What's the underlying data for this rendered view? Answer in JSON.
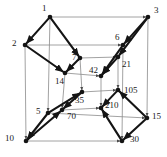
{
  "figure": {
    "kind": "hasse-diagram",
    "background_color": "#ffffff",
    "thin_edge_color": "#8a8a8a",
    "thick_edge_color": "#141414",
    "node_color": "#141414",
    "label_color": "#1a1a1a"
  },
  "chart_data": {
    "type": "diagram",
    "xlabel": "",
    "ylabel": "",
    "nodes": [
      {
        "id": "n1",
        "label": "1",
        "x": 50,
        "y": 17,
        "label_x": 42,
        "label_y": 4
      },
      {
        "id": "n2",
        "label": "2",
        "x": 25,
        "y": 45,
        "label_x": 12,
        "label_y": 39
      },
      {
        "id": "n3",
        "label": "3",
        "x": 148,
        "y": 17,
        "label_x": 154,
        "label_y": 6
      },
      {
        "id": "n5",
        "label": "5",
        "x": 48,
        "y": 113,
        "label_x": 36,
        "label_y": 107
      },
      {
        "id": "n6",
        "label": "6",
        "x": 123,
        "y": 45,
        "label_x": 115,
        "label_y": 33
      },
      {
        "id": "n7",
        "label": "7",
        "x": 80,
        "y": 58,
        "label_x": 72,
        "label_y": 53
      },
      {
        "id": "n10",
        "label": "10",
        "x": 26,
        "y": 141,
        "label_x": 5,
        "label_y": 134
      },
      {
        "id": "n14",
        "label": "14",
        "x": 65,
        "y": 73,
        "label_x": 55,
        "label_y": 77
      },
      {
        "id": "n15",
        "label": "15",
        "x": 147,
        "y": 118,
        "label_x": 152,
        "label_y": 112
      },
      {
        "id": "n21",
        "label": "21",
        "x": 118,
        "y": 57,
        "label_x": 122,
        "label_y": 60
      },
      {
        "id": "n30",
        "label": "30",
        "x": 122,
        "y": 141,
        "label_x": 130,
        "label_y": 135
      },
      {
        "id": "n35",
        "label": "35",
        "x": 82,
        "y": 92,
        "label_x": 75,
        "label_y": 96
      },
      {
        "id": "n42",
        "label": "42",
        "x": 101,
        "y": 76,
        "label_x": 89,
        "label_y": 66
      },
      {
        "id": "n70",
        "label": "70",
        "x": 62,
        "y": 110,
        "label_x": 67,
        "label_y": 112
      },
      {
        "id": "n105",
        "label": "105",
        "x": 118,
        "y": 90,
        "label_x": 124,
        "label_y": 86
      },
      {
        "id": "n210",
        "label": "210",
        "x": 101,
        "y": 108,
        "label_x": 105,
        "label_y": 101
      }
    ],
    "edges": [
      {
        "from": "n1",
        "to": "n3",
        "style": "thin"
      },
      {
        "from": "n2",
        "to": "n6",
        "style": "thin"
      },
      {
        "from": "n5",
        "to": "n15",
        "style": "thin"
      },
      {
        "from": "n10",
        "to": "n30",
        "style": "thin"
      },
      {
        "from": "n7",
        "to": "n21",
        "style": "thin"
      },
      {
        "from": "n14",
        "to": "n42",
        "style": "thin"
      },
      {
        "from": "n35",
        "to": "n105",
        "style": "thin"
      },
      {
        "from": "n70",
        "to": "n210",
        "style": "thin"
      },
      {
        "from": "n1",
        "to": "n5",
        "style": "thin"
      },
      {
        "from": "n2",
        "to": "n10",
        "style": "thin"
      },
      {
        "from": "n3",
        "to": "n15",
        "style": "thin"
      },
      {
        "from": "n6",
        "to": "n30",
        "style": "thin"
      },
      {
        "from": "n7",
        "to": "n35",
        "style": "thin"
      },
      {
        "from": "n21",
        "to": "n105",
        "style": "thin"
      },
      {
        "from": "n14",
        "to": "n70",
        "style": "thin"
      },
      {
        "from": "n42",
        "to": "n210",
        "style": "thin"
      },
      {
        "from": "n1",
        "to": "n2",
        "style": "thick"
      },
      {
        "from": "n3",
        "to": "n6",
        "style": "thick"
      },
      {
        "from": "n5",
        "to": "n10",
        "style": "thick"
      },
      {
        "from": "n15",
        "to": "n30",
        "style": "thick"
      },
      {
        "from": "n7",
        "to": "n14",
        "style": "thick"
      },
      {
        "from": "n21",
        "to": "n42",
        "style": "thick"
      },
      {
        "from": "n35",
        "to": "n70",
        "style": "thick"
      },
      {
        "from": "n105",
        "to": "n210",
        "style": "thick"
      },
      {
        "from": "n1",
        "to": "n7",
        "style": "thick"
      },
      {
        "from": "n2",
        "to": "n14",
        "style": "thick"
      },
      {
        "from": "n3",
        "to": "n21",
        "style": "thick"
      },
      {
        "from": "n6",
        "to": "n42",
        "style": "thick"
      },
      {
        "from": "n5",
        "to": "n35",
        "style": "thick"
      },
      {
        "from": "n10",
        "to": "n70",
        "style": "thick"
      },
      {
        "from": "n15",
        "to": "n105",
        "style": "thick"
      },
      {
        "from": "n30",
        "to": "n210",
        "style": "thick"
      }
    ]
  }
}
